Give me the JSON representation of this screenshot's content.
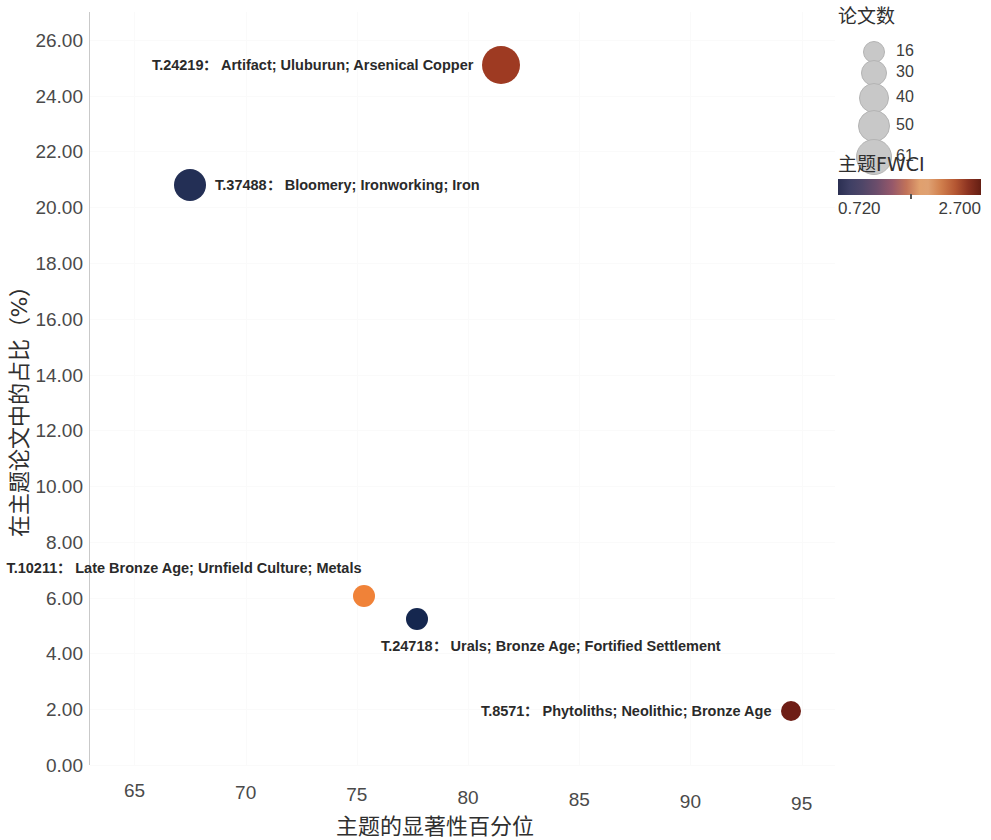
{
  "chart_data": {
    "type": "scatter",
    "title": "",
    "xlabel": "主题的显著性百分位",
    "ylabel": "在主题论文中的占比（%）",
    "xlim": [
      63.0,
      96.5
    ],
    "ylim": [
      0,
      27.0
    ],
    "xticks": [
      65,
      70,
      75,
      80,
      85,
      90,
      95
    ],
    "xtick_labels": [
      "65",
      "70",
      "75",
      "80",
      "85",
      "90",
      "95"
    ],
    "yticks": [
      0,
      2,
      4,
      6,
      8,
      10,
      12,
      14,
      16,
      18,
      20,
      22,
      24,
      26
    ],
    "ytick_labels": [
      "0.00",
      "2.00",
      "4.00",
      "6.00",
      "8.00",
      "10.00",
      "12.00",
      "14.00",
      "16.00",
      "18.00",
      "20.00",
      "22.00",
      "24.00",
      "26.00"
    ],
    "grid": true,
    "legend_position": "top-right",
    "size_encoding": "论文数",
    "color_encoding": "主题FWCI",
    "points": [
      {
        "id": "T.24219",
        "label": "T.24219：  Artifact; Uluburun; Arsenical Copper",
        "label_side": "left",
        "x": 81.5,
        "y": 25.1,
        "papers": 61,
        "fwci": 2.32,
        "color": "#9e3a22",
        "radius": 19
      },
      {
        "id": "T.37488",
        "label": "T.37488：  Bloomery; Ironworking; Iron",
        "label_side": "right",
        "x": 67.5,
        "y": 20.8,
        "papers": 50,
        "fwci": 0.86,
        "color": "#232f55",
        "radius": 16
      },
      {
        "id": "T.10211",
        "label": "T.10211：  Late Bronze Age; Urnfield Culture; Metals",
        "label_side": "left-above",
        "x": 75.3,
        "y": 6.05,
        "papers": 30,
        "fwci": 1.86,
        "color": "#f08238",
        "radius": 11
      },
      {
        "id": "T.24718",
        "label": "T.24718：  Urals; Bronze Age; Fortified Settlement",
        "label_side": "right-below",
        "x": 77.7,
        "y": 5.25,
        "papers": 30,
        "fwci": 0.8,
        "color": "#15274f",
        "radius": 11
      },
      {
        "id": "T.8571",
        "label": "T.8571：  Phytoliths; Neolithic; Bronze Age",
        "label_side": "left",
        "x": 94.5,
        "y": 1.95,
        "papers": 16,
        "fwci": 2.62,
        "color": "#6e1d15",
        "radius": 10
      }
    ],
    "size_legend": {
      "title": "论文数",
      "entries": [
        {
          "value": "16",
          "radius": 10
        },
        {
          "value": "30",
          "radius": 12
        },
        {
          "value": "40",
          "radius": 14
        },
        {
          "value": "50",
          "radius": 15
        },
        {
          "value": "61",
          "radius": 17
        }
      ]
    },
    "color_legend": {
      "title": "主题FWCI",
      "min": "0.720",
      "max": "2.700",
      "colors": [
        "#2b2f52",
        "#6b4d6b",
        "#e0a06e",
        "#b55733",
        "#641e13"
      ]
    }
  }
}
